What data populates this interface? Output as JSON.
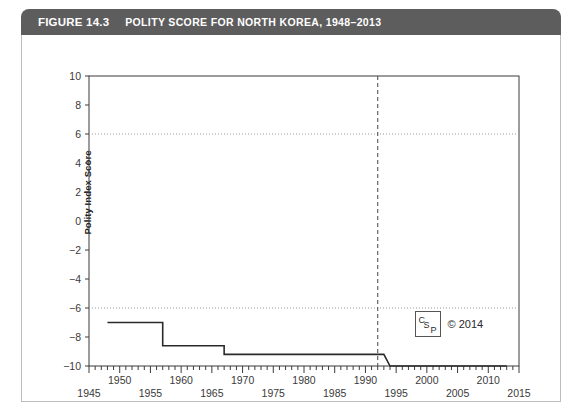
{
  "figure": {
    "number_label": "FIGURE 14.3",
    "title": "POLITY SCORE FOR NORTH KOREA, 1948–2013",
    "header_bg": "#5d5d5d",
    "header_text_color": "#ffffff"
  },
  "credit": {
    "logo_letters": {
      "c": "C",
      "s": "S",
      "p": "P"
    },
    "copyright": "© 2014"
  },
  "chart_data": {
    "type": "line",
    "title": "POLITY SCORE FOR NORTH KOREA, 1948–2013",
    "xlabel": "",
    "ylabel": "Polity Index Score",
    "xlim": [
      1945,
      2015
    ],
    "ylim": [
      -10,
      10
    ],
    "grid": "horizontal dotted gridlines at +6 and -6 only",
    "legend": "none",
    "y_ticks": [
      10,
      8,
      6,
      4,
      2,
      0,
      -2,
      -4,
      -6,
      -8,
      -10
    ],
    "y_tick_labels": [
      "10",
      "8",
      "6",
      "4",
      "2",
      "0",
      "−2",
      "−4",
      "−6",
      "−8",
      "−10"
    ],
    "x_ticks_upper": [
      1950,
      1960,
      1970,
      1980,
      1990,
      2000,
      2010
    ],
    "x_tick_labels_upper": [
      "1950",
      "1960",
      "1970",
      "1980",
      "1990",
      "2000",
      "2010"
    ],
    "x_ticks_lower": [
      1945,
      1955,
      1965,
      1975,
      1985,
      1995,
      2005,
      2015
    ],
    "x_tick_labels_lower": [
      "1945",
      "1955",
      "1965",
      "1975",
      "1985",
      "1995",
      "2005",
      "2015"
    ],
    "minor_tick_interval": 1,
    "major_tick_interval": 5,
    "gridlines": [
      {
        "y": 6,
        "style": "dotted",
        "color": "#999999"
      },
      {
        "y": -6,
        "style": "dotted",
        "color": "#999999"
      }
    ],
    "annotations": [
      {
        "type": "vline",
        "x": 1992,
        "style": "dashed",
        "color": "#555555",
        "label": ""
      }
    ],
    "series": [
      {
        "name": "Polity Index Score",
        "color": "#2a2a2a",
        "x": [
          1948,
          1957,
          1957,
          1967,
          1967,
          1993,
          1994,
          2013
        ],
        "values": [
          -7,
          -7,
          -8.6,
          -8.6,
          -9.2,
          -9.2,
          -10,
          -10
        ]
      }
    ]
  }
}
